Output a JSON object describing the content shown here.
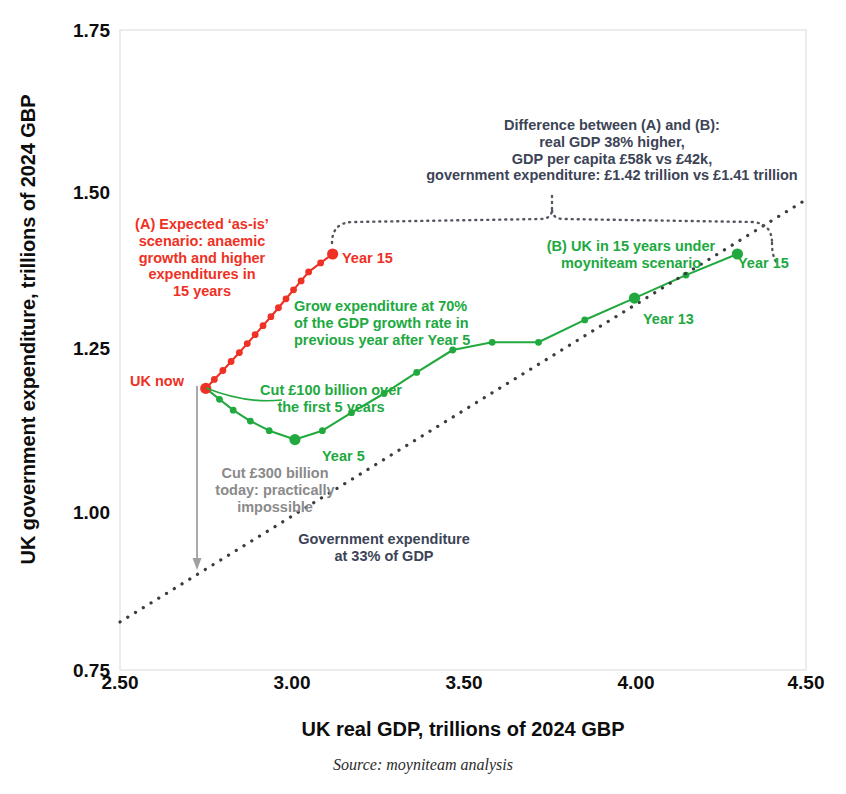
{
  "chart_data": {
    "type": "line",
    "title": "",
    "xlabel": "UK real GDP, trillions of 2024 GBP",
    "ylabel": "UK government expenditure, trillions of 2024 GBP",
    "xlim": [
      2.5,
      4.5
    ],
    "ylim": [
      0.75,
      1.75
    ],
    "xticks": [
      "2.50",
      "3.00",
      "3.50",
      "4.00",
      "4.50"
    ],
    "yticks": [
      "1.75",
      "1.50",
      "1.25",
      "1.00",
      "0.75"
    ],
    "grid": false,
    "legend": "none",
    "series": [
      {
        "name": "(A) Expected 'as-is' scenario",
        "color": "#ee3124",
        "style": "line-markers",
        "points": [
          [
            2.75,
            1.19
          ],
          [
            2.775,
            1.204
          ],
          [
            2.8,
            1.218
          ],
          [
            2.824,
            1.232
          ],
          [
            2.848,
            1.246
          ],
          [
            2.871,
            1.26
          ],
          [
            2.894,
            1.274
          ],
          [
            2.917,
            1.288
          ],
          [
            2.94,
            1.302
          ],
          [
            2.962,
            1.316
          ],
          [
            2.984,
            1.33
          ],
          [
            3.006,
            1.344
          ],
          [
            3.028,
            1.358
          ],
          [
            3.05,
            1.372
          ],
          [
            3.085,
            1.386
          ],
          [
            3.12,
            1.4
          ]
        ]
      },
      {
        "name": "(B) moyniteam scenario",
        "color": "#21a93f",
        "style": "line-markers",
        "points": [
          [
            2.75,
            1.19
          ],
          [
            2.79,
            1.173
          ],
          [
            2.83,
            1.156
          ],
          [
            2.88,
            1.139
          ],
          [
            2.935,
            1.124
          ],
          [
            3.01,
            1.11
          ],
          [
            3.09,
            1.124
          ],
          [
            3.175,
            1.152
          ],
          [
            3.27,
            1.182
          ],
          [
            3.365,
            1.215
          ],
          [
            3.47,
            1.25
          ],
          [
            3.585,
            1.262
          ],
          [
            3.72,
            1.262
          ],
          [
            3.855,
            1.297
          ],
          [
            4.0,
            1.331
          ],
          [
            4.15,
            1.367
          ],
          [
            4.3,
            1.4
          ]
        ]
      },
      {
        "name": "Government expenditure at 33% of GDP",
        "color": "#3c3c3c",
        "style": "dotted",
        "points": [
          [
            2.5,
            0.825
          ],
          [
            4.5,
            1.485
          ]
        ]
      }
    ],
    "markers": [
      {
        "label": "UK now",
        "x": 2.75,
        "y": 1.19,
        "color": "#ee3124"
      },
      {
        "label": "Year 15",
        "x": 3.12,
        "y": 1.4,
        "color": "#ee3124"
      },
      {
        "label": "Year 5",
        "x": 3.01,
        "y": 1.11,
        "color": "#21a93f"
      },
      {
        "label": "Year 13",
        "x": 4.0,
        "y": 1.331,
        "color": "#21a93f"
      },
      {
        "label": "Year 15",
        "x": 4.3,
        "y": 1.4,
        "color": "#21a93f"
      }
    ],
    "annotations": [
      {
        "id": "brace-note",
        "color": "#3c4456",
        "lines": [
          "Difference between (A) and (B):",
          "real GDP 38% higher,",
          "GDP per capita £58k vs £42k,",
          "government expenditure: £1.42 trillion vs £1.41 trillion"
        ]
      },
      {
        "id": "scenario-a",
        "color": "#ee3124",
        "lines": [
          "(A) Expected ‘as-is’",
          "scenario: anaemic",
          "growth and higher",
          "expenditures in",
          "15 years"
        ]
      },
      {
        "id": "scenario-b",
        "color": "#21a93f",
        "lines": [
          "(B) UK in 15 years under",
          "moyniteam scenario"
        ]
      },
      {
        "id": "grow-expenditure",
        "color": "#21a93f",
        "lines": [
          "Grow expenditure at 70%",
          "of the GDP growth rate in",
          "previous year after Year 5"
        ]
      },
      {
        "id": "cut-100",
        "color": "#21a93f",
        "lines": [
          "Cut £100 billion over",
          "the first 5 years"
        ]
      },
      {
        "id": "cut-300",
        "color": "#8a8a8a",
        "lines": [
          "Cut £300 billion",
          "today: practically",
          "impossible"
        ]
      },
      {
        "id": "gov-33",
        "color": "#3c4456",
        "lines": [
          "Government expenditure",
          "at 33% of GDP"
        ]
      }
    ]
  },
  "axes": {
    "ylabel": "UK government expenditure, trillions of 2024 GBP",
    "xlabel": "UK real GDP, trillions of 2024 GBP",
    "yticks": {
      "t0": "1.75",
      "t1": "1.50",
      "t2": "1.25",
      "t3": "1.00",
      "t4": "0.75"
    },
    "xticks": {
      "t0": "2.50",
      "t1": "3.00",
      "t2": "3.50",
      "t3": "4.00",
      "t4": "4.50"
    }
  },
  "labels": {
    "uk_now": "UK now",
    "year15_red": "Year 15",
    "year5": "Year 5",
    "year13": "Year 13",
    "year15_green": "Year 15"
  },
  "notes": {
    "brace": {
      "l1": "Difference between (A) and (B):",
      "l2": "real GDP 38% higher,",
      "l3": "GDP per capita £58k vs £42k,",
      "l4": "government expenditure: £1.42 trillion vs £1.41 trillion"
    },
    "scenario_a": {
      "l1": "(A) Expected ‘as-is’",
      "l2": "scenario: anaemic",
      "l3": "growth and higher",
      "l4": "expenditures in",
      "l5": "15 years"
    },
    "scenario_b": {
      "l1": "(B) UK in 15 years under",
      "l2": "moyniteam scenario"
    },
    "grow": {
      "l1": "Grow expenditure at 70%",
      "l2": "of the GDP growth rate in",
      "l3": "previous year after Year 5"
    },
    "cut100": {
      "l1": "Cut £100 billion over",
      "l2": "the first 5 years"
    },
    "cut300": {
      "l1": "Cut £300 billion",
      "l2": "today: practically",
      "l3": "impossible"
    },
    "gov33": {
      "l1": "Government expenditure",
      "l2": "at 33% of GDP"
    }
  },
  "source": "Source: moyniteam analysis",
  "colors": {
    "red": "#ee3124",
    "green": "#21a93f",
    "grey": "#8a8a8a",
    "dark": "#3c4456"
  }
}
